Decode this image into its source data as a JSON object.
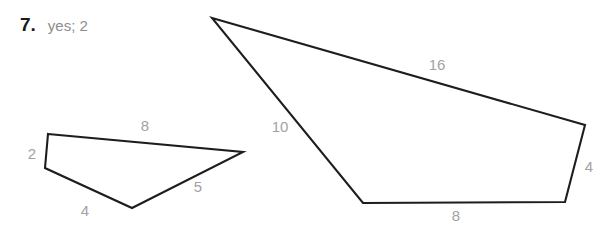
{
  "problem": {
    "number": "7.",
    "answer": "yes; 2"
  },
  "figures": [
    {
      "name": "small-quadrilateral",
      "vertices": [
        [
          48,
          134
        ],
        [
          243,
          152
        ],
        [
          132,
          208
        ],
        [
          45,
          168
        ]
      ],
      "edge_labels": [
        {
          "name": "edge-label-8-top-left",
          "text": "8",
          "x": 145,
          "y": 127,
          "anchor": "middle"
        },
        {
          "name": "edge-label-5-right-left",
          "text": "5",
          "x": 198,
          "y": 188,
          "anchor": "middle"
        },
        {
          "name": "edge-label-4-bottom-left",
          "text": "4",
          "x": 85,
          "y": 212,
          "anchor": "middle"
        },
        {
          "name": "edge-label-2-left-left",
          "text": "2",
          "x": 32,
          "y": 155,
          "anchor": "middle"
        }
      ]
    },
    {
      "name": "large-quadrilateral",
      "vertices": [
        [
          212,
          18
        ],
        [
          585,
          125
        ],
        [
          565,
          202
        ],
        [
          363,
          203
        ]
      ],
      "edge_labels": [
        {
          "name": "edge-label-16-top-right",
          "text": "16",
          "x": 437,
          "y": 66,
          "anchor": "middle"
        },
        {
          "name": "edge-label-4-right-right",
          "text": "4",
          "x": 589,
          "y": 168,
          "anchor": "middle"
        },
        {
          "name": "edge-label-8-bottom-right",
          "text": "8",
          "x": 456,
          "y": 217,
          "anchor": "middle"
        },
        {
          "name": "edge-label-10-left-right",
          "text": "10",
          "x": 280,
          "y": 128,
          "anchor": "middle"
        }
      ]
    }
  ],
  "colors": {
    "stroke": "#1d1d1d",
    "label": "#a2a2a2",
    "answer_text": "#8d8d8d",
    "number_text": "#1a1a1a",
    "background": "#ffffff"
  }
}
